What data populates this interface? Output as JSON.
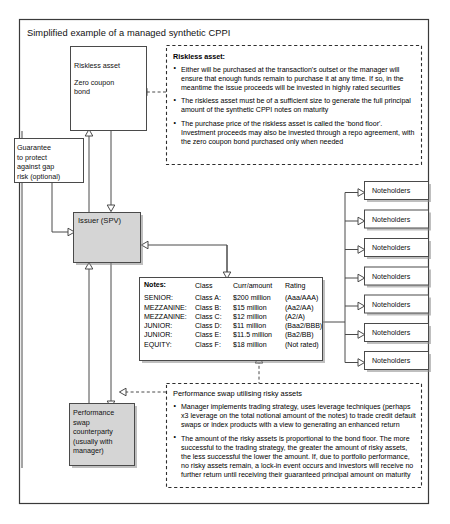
{
  "title": "Simplified example of a managed synthetic CPPI",
  "boxes": {
    "riskless_asset": {
      "line1": "Riskless asset",
      "line2": "Zero coupon\nbond"
    },
    "guarantee": {
      "text": "Guarantee\nto protect\nagainst gap\nrisk (optional)"
    },
    "issuer": {
      "text": "Issuer (SPV)"
    },
    "swap_counterparty": {
      "text": "Performance\nswap\ncounterparty\n(usually with\nmanager)"
    }
  },
  "noteholders": {
    "label": "Noteholders",
    "items": [
      {
        "label": "Noteholders"
      },
      {
        "label": "Noteholders"
      },
      {
        "label": "Noteholders"
      },
      {
        "label": "Noteholders"
      },
      {
        "label": "Noteholders"
      },
      {
        "label": "Noteholders"
      },
      {
        "label": "Noteholders"
      }
    ]
  },
  "notes_table": {
    "title": "Notes:",
    "headers": [
      "Class",
      "Curr/amount",
      "Rating"
    ],
    "rows": [
      {
        "tranche": "SENIOR:",
        "class": "Class A:",
        "amount": "$200 million",
        "rating": "(Aaa/AAA)"
      },
      {
        "tranche": "MEZZANINE:",
        "class": "Class B:",
        "amount": "$15 million",
        "rating": "(Aa2/AA)"
      },
      {
        "tranche": "MEZZANINE:",
        "class": "Class C:",
        "amount": "$12 million",
        "rating": "(A2/A)"
      },
      {
        "tranche": "JUNIOR:",
        "class": "Class D:",
        "amount": "$11 million",
        "rating": "(Baa2/BBB)"
      },
      {
        "tranche": "JUNIOR:",
        "class": "Class E:",
        "amount": "$11.5 million",
        "rating": "(Ba2/BB)"
      },
      {
        "tranche": "EQUITY:",
        "class": "Class F:",
        "amount": "$18 million",
        "rating": "(Not rated)"
      }
    ]
  },
  "callout_riskless": {
    "title": "Riskless asset:",
    "bullets": [
      "Either will be purchased at the transaction's outset or the manager will ensure that enough funds remain to purchase it at any time. If so, in the meantime the issue proceeds will be invested in highly rated securities",
      "The riskless asset must be of a sufficient size to generate the full principal amount of the synthetic CPPI notes on maturity",
      "The purchase price of the riskless asset is called the 'bond floor'. Investment proceeds may also be invested through a repo agreement, with the zero coupon bond purchased only when needed"
    ]
  },
  "callout_swap": {
    "title": "Performance swap utilising risky assets",
    "bullets": [
      "Manager implements trading strategy, uses leverage techniques (perhaps x3 leverage on the total notional amount of the notes) to trade credit default swaps or index products with a view to generating an enhanced return",
      "The amount of the risky assets is proportional to the bond floor. The more successful to the trading strategy, the greater the amount of risky assets, the less successful the lower the amount. If, due to portfolio performance, no risky assets remain, a lock-in event occurs and investors will receive no further return until receiving their guaranteed principal amount on maturity"
    ]
  },
  "colors": {
    "frame_stroke": "#3a3a3a",
    "box_fill": "#ffffff",
    "box_gray_fill": "#d5d5d5",
    "line": "#4a4a4a",
    "text": "#111111"
  }
}
